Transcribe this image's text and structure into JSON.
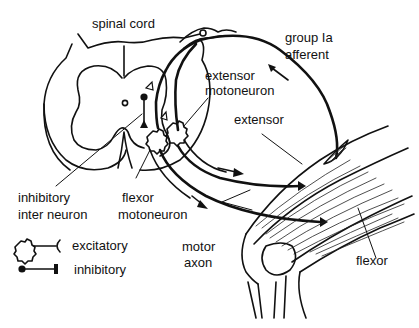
{
  "diagram": {
    "type": "anatomical-schematic",
    "labels": {
      "spinal_cord": "spinal cord",
      "group_ia_line1": "group Ia",
      "group_ia_line2": "afferent",
      "extensor_motoneuron_line1": "extensor",
      "extensor_motoneuron_line2": "motoneuron",
      "extensor_muscle": "extensor",
      "inhibitory_interneuron_line1": "inhibitory",
      "inhibitory_interneuron_line2": "inter neuron",
      "flexor_motoneuron_line1": "flexor",
      "flexor_motoneuron_line2": "motoneuron",
      "motor_axon_line1": "motor",
      "motor_axon_line2": "axon",
      "flexor_muscle": "flexor"
    },
    "legend": [
      {
        "symbol": "excitatory-synapse-icon",
        "label": "excitatory"
      },
      {
        "symbol": "inhibitory-synapse-icon",
        "label": "inhibitory"
      }
    ],
    "colors": {
      "ink": "#111111",
      "background": "#ffffff"
    }
  }
}
